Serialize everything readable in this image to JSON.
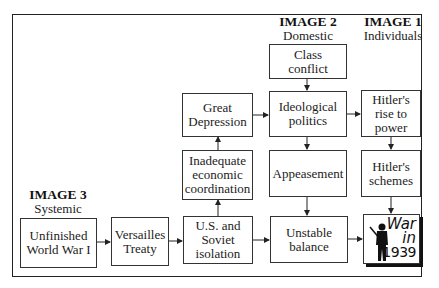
{
  "levels": {
    "image1": {
      "title": "IMAGE 1",
      "subtitle": "Individuals"
    },
    "image2": {
      "title": "IMAGE 2",
      "subtitle": "Domestic"
    },
    "image3": {
      "title": "IMAGE 3",
      "subtitle": "Systemic"
    }
  },
  "nodes": {
    "class_conflict": "Class\nconflict",
    "great_depression": "Great\nDepression",
    "ideological_politics": "Ideological\npolitics",
    "hitlers_rise": "Hitler's\nrise to\npower",
    "inadequate_coordination": "Inadequate\neconomic\ncoordination",
    "appeasement": "Appeasement",
    "hitlers_schemes": "Hitler's\nschemes",
    "unfinished_ww1": "Unfinished\nWorld War I",
    "versailles": "Versailles\nTreaty",
    "us_soviet_isolation": "U.S. and\nSoviet\nisolation",
    "unstable_balance": "Unstable\nbalance",
    "war": {
      "line1": "War",
      "line2": "in",
      "line3": "1939",
      "icon": "soldier-silhouette-icon"
    }
  },
  "edges": [
    [
      "unfinished_ww1",
      "versailles"
    ],
    [
      "versailles",
      "us_soviet_isolation"
    ],
    [
      "us_soviet_isolation",
      "inadequate_coordination"
    ],
    [
      "inadequate_coordination",
      "great_depression"
    ],
    [
      "great_depression",
      "ideological_politics"
    ],
    [
      "class_conflict",
      "ideological_politics"
    ],
    [
      "ideological_politics",
      "hitlers_rise"
    ],
    [
      "ideological_politics",
      "appeasement"
    ],
    [
      "appeasement",
      "unstable_balance"
    ],
    [
      "us_soviet_isolation",
      "unstable_balance"
    ],
    [
      "hitlers_rise",
      "hitlers_schemes"
    ],
    [
      "hitlers_schemes",
      "war"
    ],
    [
      "unstable_balance",
      "war"
    ]
  ]
}
